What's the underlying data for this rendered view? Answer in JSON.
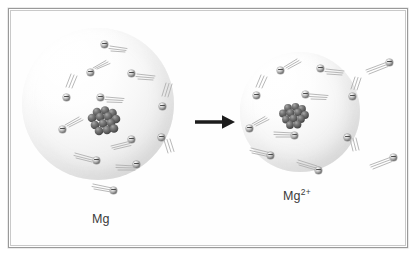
{
  "figure": {
    "background_color": "#ffffff",
    "frame_color": "#9a9a9a",
    "width": 418,
    "height": 257
  },
  "labels": {
    "left_species": "Mg",
    "right_species_base": "Mg",
    "right_species_charge": "2+"
  },
  "arrow": {
    "name": "reaction-arrow",
    "direction": "right",
    "color": "#1c1c1c"
  },
  "atoms": [
    {
      "id": "atom-left",
      "species": "Mg",
      "electron_count": 12,
      "nucleus_particles": 13,
      "sphere_color": "#ededed",
      "radius_px": 76
    },
    {
      "id": "atom-right",
      "species": "Mg2+",
      "electron_count": 10,
      "nucleus_particles": 12,
      "sphere_color": "#ededed",
      "radius_px": 60
    }
  ],
  "electron": {
    "symbol": "-",
    "fill_color": "#9b9b9b",
    "trail_color": "#b0b0b0"
  },
  "nucleus": {
    "particle_color": "#595959",
    "particle_highlight": "#9a9a9a"
  },
  "free_electrons": {
    "count": 2,
    "description": "two electrons released from the magnesium atom"
  }
}
